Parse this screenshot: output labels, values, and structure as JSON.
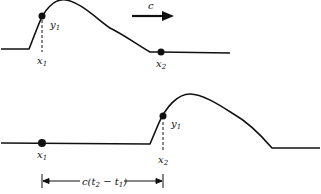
{
  "diagram": {
    "colors": {
      "stroke": "#111111",
      "background": "#ffffff"
    },
    "top_panel": {
      "point_labels": {
        "x1": "x",
        "x1_sub": "1",
        "y1": "y",
        "y1_sub": "1",
        "x2": "x",
        "x2_sub": "2"
      },
      "velocity_label": "c",
      "velocity_arrow": "right-arrow"
    },
    "bottom_panel": {
      "point_labels": {
        "x1": "x",
        "x1_sub": "1",
        "x2": "x",
        "x2_sub": "2",
        "y1": "y",
        "y1_sub": "1"
      },
      "distance_label": "c(t",
      "distance_sub1": "2",
      "distance_mid": " − t",
      "distance_sub2": "1",
      "distance_end": ")"
    }
  }
}
